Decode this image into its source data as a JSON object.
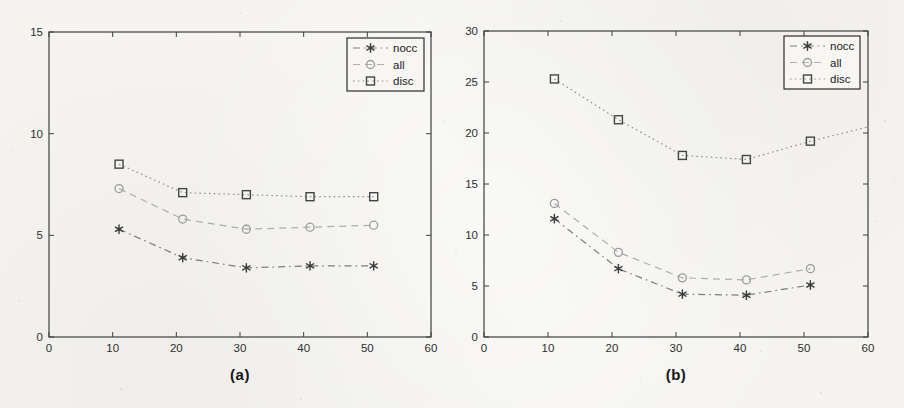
{
  "page": {
    "background": "#f5f4f1",
    "axis_color": "#3f3f3f",
    "tick_label_color": "#2e2e2e",
    "legend_background": "#f7f6f3",
    "legend_border": "#2c2c2c"
  },
  "chart_data": [
    {
      "id": "a",
      "type": "line",
      "caption": "(a)",
      "title": "",
      "xlabel": "",
      "ylabel": "",
      "xlim": [
        0,
        60
      ],
      "ylim": [
        0,
        15
      ],
      "xticks": [
        "0",
        "10",
        "20",
        "30",
        "40",
        "50",
        "60"
      ],
      "yticks": [
        "0",
        "5",
        "10",
        "15"
      ],
      "grid": false,
      "legend_position": "top-right",
      "x": [
        11,
        21,
        31,
        41,
        51
      ],
      "series": [
        {
          "name": "nocc",
          "marker": "star",
          "linestyle": "dashdot",
          "line_color": "#7c7c7c",
          "marker_color": "#3b3b3b",
          "values": [
            5.3,
            3.9,
            3.4,
            3.5,
            3.5
          ]
        },
        {
          "name": "all",
          "marker": "circle",
          "linestyle": "dashed",
          "line_color": "#aeaeae",
          "marker_color": "#9c9c9c",
          "values": [
            7.3,
            5.8,
            5.3,
            5.4,
            5.5
          ]
        },
        {
          "name": "disc",
          "marker": "square",
          "linestyle": "dotted",
          "line_color": "#8f8f8f",
          "marker_color": "#454545",
          "values": [
            8.5,
            7.1,
            7.0,
            6.9,
            6.9
          ]
        }
      ]
    },
    {
      "id": "b",
      "type": "line",
      "caption": "(b)",
      "title": "",
      "xlabel": "",
      "ylabel": "",
      "xlim": [
        0,
        60
      ],
      "ylim": [
        0,
        30
      ],
      "xticks": [
        "0",
        "10",
        "20",
        "30",
        "40",
        "50",
        "60"
      ],
      "yticks": [
        "0",
        "5",
        "10",
        "15",
        "20",
        "25",
        "30"
      ],
      "grid": false,
      "legend_position": "top-right",
      "x": [
        11,
        21,
        31,
        41,
        51
      ],
      "series": [
        {
          "name": "nocc",
          "marker": "star",
          "linestyle": "dashdot",
          "line_color": "#7c7c7c",
          "marker_color": "#3b3b3b",
          "values": [
            11.6,
            6.7,
            4.2,
            4.1,
            5.1
          ]
        },
        {
          "name": "all",
          "marker": "circle",
          "linestyle": "dashed",
          "line_color": "#aeaeae",
          "marker_color": "#9c9c9c",
          "values": [
            13.1,
            8.3,
            5.8,
            5.6,
            6.7
          ]
        },
        {
          "name": "disc",
          "marker": "square",
          "linestyle": "dotted",
          "line_color": "#8f8f8f",
          "marker_color": "#454545",
          "values": [
            25.3,
            21.3,
            17.8,
            17.4,
            19.2
          ],
          "line_tail": {
            "x": 60,
            "y": 20.6
          }
        }
      ]
    }
  ]
}
